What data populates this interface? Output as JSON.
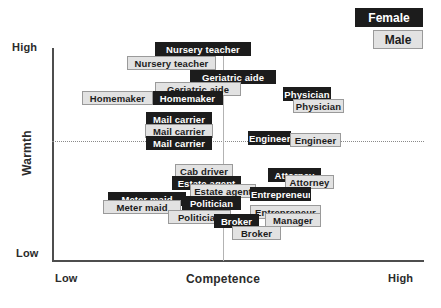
{
  "chart_data": {
    "type": "scatter",
    "title": "",
    "xlabel": "Competence",
    "ylabel": "Warmth",
    "xlim": [
      "Low",
      "High"
    ],
    "ylim": [
      "Low",
      "High"
    ],
    "xtick_low": "Low",
    "xtick_high": "High",
    "ytick_low": "Low",
    "ytick_high": "High",
    "grid": "dotted midlines at mid-warmth and mid-competence",
    "legend_position": "top-right",
    "series": [
      {
        "name": "Female",
        "color": "#1c1c1c"
      },
      {
        "name": "Male",
        "color": "#e2e2e2"
      }
    ],
    "points": [
      {
        "label": "Nursery teacher",
        "group": "Female",
        "x": 155,
        "y": 42,
        "w": 96
      },
      {
        "label": "Nursery teacher",
        "group": "Male",
        "x": 127,
        "y": 56,
        "w": 89
      },
      {
        "label": "Geriatric aide",
        "group": "Female",
        "x": 190,
        "y": 70,
        "w": 86
      },
      {
        "label": "Geriatric aide",
        "group": "Male",
        "x": 155,
        "y": 82,
        "w": 86
      },
      {
        "label": "Homemaker",
        "group": "Female",
        "x": 152,
        "y": 91,
        "w": 71
      },
      {
        "label": "Homemaker",
        "group": "Male",
        "x": 82,
        "y": 91,
        "w": 71
      },
      {
        "label": "Physician",
        "group": "Female",
        "x": 283,
        "y": 87,
        "w": 48
      },
      {
        "label": "Physician",
        "group": "Male",
        "x": 293,
        "y": 99,
        "w": 51
      },
      {
        "label": "Mail carrier",
        "group": "Female",
        "x": 146,
        "y": 112,
        "w": 66
      },
      {
        "label": "Mail carrier",
        "group": "Male",
        "x": 145,
        "y": 124,
        "w": 68
      },
      {
        "label": "Mail carrier",
        "group": "Female",
        "x": 146,
        "y": 136,
        "w": 66
      },
      {
        "label": "Engineer",
        "group": "Female",
        "x": 248,
        "y": 131,
        "w": 43
      },
      {
        "label": "Engineer",
        "group": "Male",
        "x": 290,
        "y": 133,
        "w": 51
      },
      {
        "label": "Cab driver",
        "group": "Male",
        "x": 175,
        "y": 164,
        "w": 58
      },
      {
        "label": "Attorney",
        "group": "Female",
        "x": 268,
        "y": 168,
        "w": 53
      },
      {
        "label": "Attorney",
        "group": "Male",
        "x": 285,
        "y": 175,
        "w": 49
      },
      {
        "label": "Estate agent",
        "group": "Female",
        "x": 172,
        "y": 176,
        "w": 69
      },
      {
        "label": "Estate agent",
        "group": "Male",
        "x": 190,
        "y": 184,
        "w": 66
      },
      {
        "label": "Entrepreneur",
        "group": "Female",
        "x": 250,
        "y": 187,
        "w": 61
      },
      {
        "label": "Meter maid",
        "group": "Female",
        "x": 108,
        "y": 192,
        "w": 78
      },
      {
        "label": "Politician",
        "group": "Female",
        "x": 182,
        "y": 196,
        "w": 59
      },
      {
        "label": "Meter maid",
        "group": "Male",
        "x": 103,
        "y": 200,
        "w": 78
      },
      {
        "label": "Entrepreneur",
        "group": "Male",
        "x": 250,
        "y": 205,
        "w": 71
      },
      {
        "label": "Politician",
        "group": "Male",
        "x": 168,
        "y": 210,
        "w": 63
      },
      {
        "label": "Manager",
        "group": "Male",
        "x": 265,
        "y": 213,
        "w": 56
      },
      {
        "label": "Broker",
        "group": "Female",
        "x": 214,
        "y": 214,
        "w": 45
      },
      {
        "label": "Broker",
        "group": "Male",
        "x": 232,
        "y": 226,
        "w": 49
      }
    ]
  },
  "legend": {
    "female_label": "Female",
    "male_label": "Male"
  },
  "axes": {
    "x_title": "Competence",
    "y_title": "Warmth",
    "x_low": "Low",
    "x_high": "High",
    "y_low": "Low",
    "y_high": "High"
  }
}
